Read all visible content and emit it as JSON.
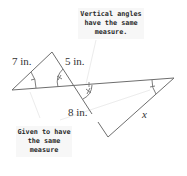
{
  "diagram": {
    "type": "similar-triangles",
    "callouts": {
      "top": {
        "lines": [
          "Vertical angles",
          "have the same",
          "measure."
        ]
      },
      "bottom": {
        "lines": [
          "Given to have",
          "the same",
          "measure"
        ]
      }
    },
    "labels": {
      "left_side": "7 in.",
      "upper_right_side": "5 in.",
      "lower_left_side": "8 in.",
      "unknown_side": "x"
    },
    "vertices": {
      "A_left": [
        12,
        90
      ],
      "B_top": [
        52,
        52
      ],
      "C_cross": [
        75,
        86
      ],
      "D_right": [
        174,
        78
      ],
      "E_bottom": [
        108,
        137
      ]
    },
    "colors": {
      "line": "#6e6e6e",
      "callout_bg": "#f7f7f7",
      "text": "#2a2a2a"
    }
  }
}
